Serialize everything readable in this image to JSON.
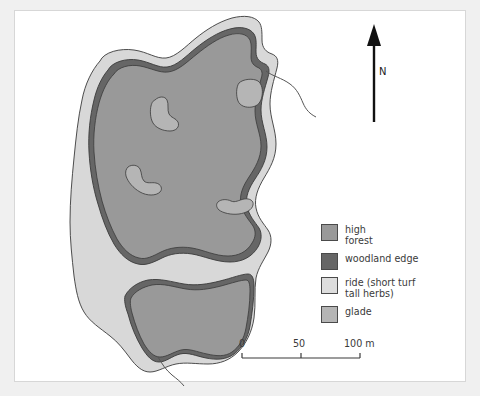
{
  "figure": {
    "kind": "woodland-habitat-map",
    "background_color": "#f0f0f0",
    "panel_color": "#ffffff",
    "panel_border_color": "#d7d7d7"
  },
  "colors": {
    "high_forest": "#999999",
    "woodland_edge": "#666666",
    "ride": "#d8d8d8",
    "glade": "#b5b5b5",
    "outline": "#3a3a3a",
    "track": "#555555",
    "text": "#3a3a3a"
  },
  "north_arrow": {
    "label": "N",
    "icon": "north-arrow-icon"
  },
  "legend": {
    "items": [
      {
        "label": "high\nforest",
        "swatch": "#999999",
        "name": "high-forest"
      },
      {
        "label": "woodland edge",
        "swatch": "#666666",
        "name": "woodland-edge"
      },
      {
        "label": "ride (short turf\ntall herbs)",
        "swatch": "#dddddd",
        "name": "ride"
      },
      {
        "label": "glade",
        "swatch": "#b5b5b5",
        "name": "glade"
      }
    ]
  },
  "scale_bar": {
    "ticks": [
      "0",
      "50",
      "100 m"
    ],
    "unit": "m",
    "min": 0,
    "max": 100
  },
  "map_features": {
    "habitats": [
      "high forest",
      "woodland edge",
      "ride (short turf tall herbs)",
      "glade"
    ],
    "glade_count": 4,
    "track_count": 2
  }
}
